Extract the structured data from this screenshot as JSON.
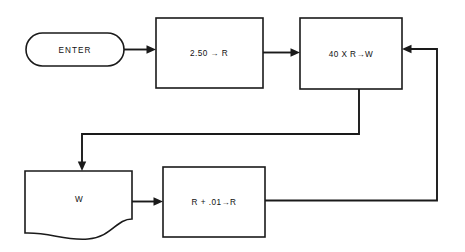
{
  "diagram": {
    "background_color": "#ffffff",
    "stroke_color": "#1a1a1a",
    "nodes": [
      {
        "id": "enter",
        "kind": "terminator",
        "label": "ENTER",
        "x": 26,
        "y": 33,
        "w": 98,
        "h": 33
      },
      {
        "id": "set-r",
        "kind": "process",
        "label": "2.50 → R",
        "x": 156,
        "y": 18,
        "w": 107,
        "h": 70
      },
      {
        "id": "compute-w",
        "kind": "process",
        "label": "40 X R→W",
        "x": 300,
        "y": 18,
        "w": 102,
        "h": 71
      },
      {
        "id": "print-w",
        "kind": "document",
        "label": "W",
        "x": 25,
        "y": 171,
        "w": 107,
        "h": 74
      },
      {
        "id": "increment-r",
        "kind": "process",
        "label": "R + .01→R",
        "x": 163,
        "y": 167,
        "w": 102,
        "h": 70
      }
    ],
    "connectors": [
      {
        "id": "enter-to-set-r",
        "from": "enter",
        "to": "set-r",
        "arrow": true
      },
      {
        "id": "set-r-to-compute-w",
        "from": "set-r",
        "to": "compute-w",
        "arrow": true
      },
      {
        "id": "compute-w-to-print-w",
        "from": "compute-w",
        "to": "print-w",
        "arrow": true
      },
      {
        "id": "print-w-to-increment-r",
        "from": "print-w",
        "to": "increment-r",
        "arrow": true
      },
      {
        "id": "increment-r-to-compute-w-loop",
        "from": "increment-r",
        "to": "compute-w",
        "arrow": true
      }
    ]
  }
}
